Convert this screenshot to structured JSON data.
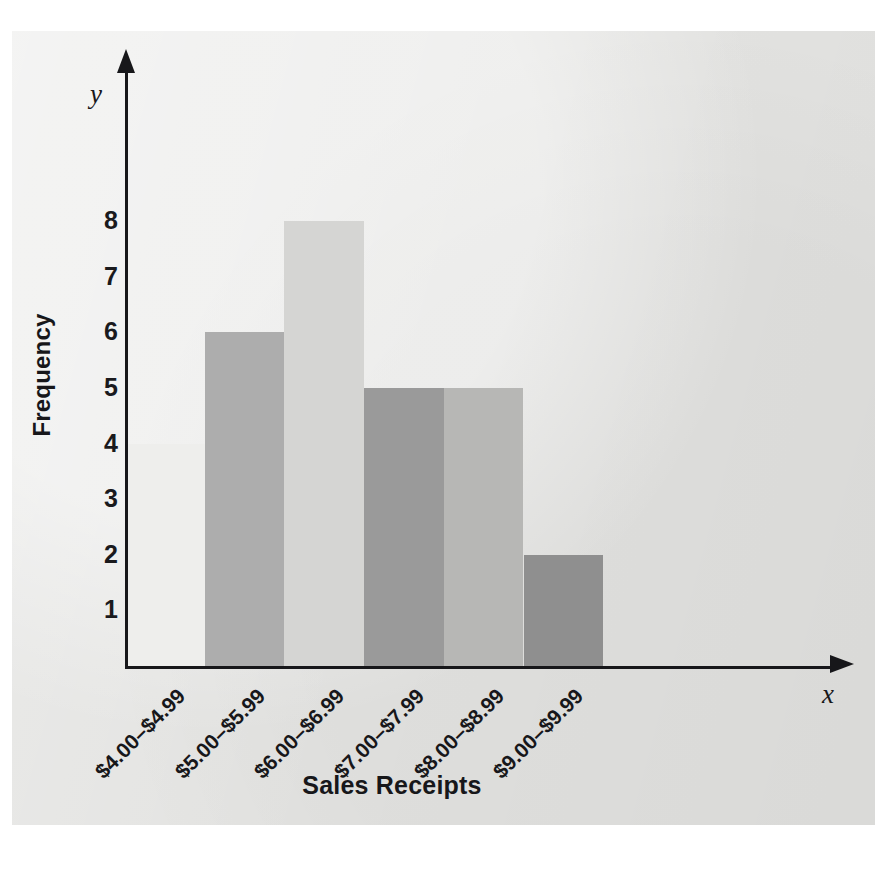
{
  "figure": {
    "panel_background": "#e3e3e1",
    "axis_color": "#17171a",
    "y_var_label": "y",
    "x_var_label": "x"
  },
  "chart_data": {
    "type": "bar",
    "title": "",
    "subtitle": "",
    "xlabel": "Sales Receipts",
    "ylabel": "Frequency",
    "categories": [
      "$4.00–$4.99",
      "$5.00–$5.99",
      "$6.00–$6.99",
      "$7.00–$7.99",
      "$8.00–$8.99",
      "$9.00–$9.99"
    ],
    "values": [
      4,
      6,
      8,
      5,
      5,
      2
    ],
    "bar_colors": [
      "#eeeeec",
      "#adadad",
      "#d5d5d3",
      "#9a9a9a",
      "#b7b7b5",
      "#8f8f8f"
    ],
    "ylim": [
      0,
      9
    ],
    "yticks": [
      1,
      2,
      3,
      4,
      5,
      6,
      7,
      8
    ],
    "ytick_labels": [
      "1",
      "2",
      "3",
      "4",
      "5",
      "6",
      "7",
      "8"
    ],
    "grid": false,
    "legend": false,
    "legend_position": "none",
    "axis_style": "arrow-tipped",
    "xtick_label_rotation": 45,
    "annotations": []
  }
}
